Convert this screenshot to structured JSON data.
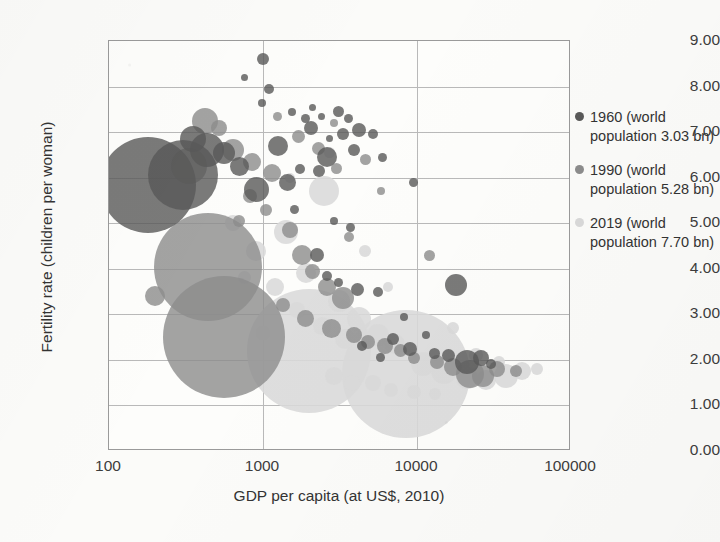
{
  "chart_data": {
    "type": "scatter",
    "title": "",
    "xlabel": "GDP per capita (at US$, 2010)",
    "ylabel": "Fertility rate (children per woman)",
    "x_scale": "log",
    "xlim": [
      100,
      100000
    ],
    "ylim": [
      0,
      9
    ],
    "xticks": [
      "100",
      "1000",
      "10000",
      "100000"
    ],
    "yticks": [
      "0.00",
      "1.00",
      "2.00",
      "3.00",
      "4.00",
      "5.00",
      "6.00",
      "7.00",
      "8.00",
      "9.00"
    ],
    "grid": "horizontal and vertical gridlines at tick values",
    "legend_position": "right",
    "bubble_encoding": "bubble area is proportional to country population",
    "series": [
      {
        "name": "1960 (world population 3.03 bn)",
        "year": 1960,
        "world_population_bn": 3.03,
        "color": "#595959",
        "points": [
          {
            "x": 180,
            "y": 5.85,
            "size": 96
          },
          {
            "x": 300,
            "y": 6.05,
            "size": 70
          },
          {
            "x": 430,
            "y": 6.6,
            "size": 34
          },
          {
            "x": 350,
            "y": 6.85,
            "size": 26
          },
          {
            "x": 560,
            "y": 6.55,
            "size": 22
          },
          {
            "x": 700,
            "y": 6.25,
            "size": 19
          },
          {
            "x": 900,
            "y": 5.75,
            "size": 25
          },
          {
            "x": 1250,
            "y": 6.7,
            "size": 20
          },
          {
            "x": 1000,
            "y": 8.6,
            "size": 12
          },
          {
            "x": 760,
            "y": 8.2,
            "size": 7
          },
          {
            "x": 1100,
            "y": 7.95,
            "size": 10
          },
          {
            "x": 980,
            "y": 7.65,
            "size": 8
          },
          {
            "x": 1550,
            "y": 7.45,
            "size": 8
          },
          {
            "x": 1900,
            "y": 7.3,
            "size": 9
          },
          {
            "x": 2100,
            "y": 7.55,
            "size": 7
          },
          {
            "x": 2400,
            "y": 7.35,
            "size": 7
          },
          {
            "x": 2050,
            "y": 7.1,
            "size": 14
          },
          {
            "x": 3100,
            "y": 7.45,
            "size": 11
          },
          {
            "x": 3600,
            "y": 7.3,
            "size": 9
          },
          {
            "x": 2700,
            "y": 6.85,
            "size": 7
          },
          {
            "x": 3300,
            "y": 6.95,
            "size": 12
          },
          {
            "x": 4200,
            "y": 7.05,
            "size": 14
          },
          {
            "x": 2600,
            "y": 6.45,
            "size": 20
          },
          {
            "x": 1750,
            "y": 6.2,
            "size": 10
          },
          {
            "x": 2300,
            "y": 6.15,
            "size": 12
          },
          {
            "x": 1450,
            "y": 5.9,
            "size": 17
          },
          {
            "x": 3900,
            "y": 6.6,
            "size": 12
          },
          {
            "x": 5200,
            "y": 6.95,
            "size": 10
          },
          {
            "x": 6000,
            "y": 6.45,
            "size": 9
          },
          {
            "x": 1600,
            "y": 5.3,
            "size": 9
          },
          {
            "x": 2900,
            "y": 5.05,
            "size": 8
          },
          {
            "x": 3700,
            "y": 4.9,
            "size": 9
          },
          {
            "x": 2250,
            "y": 4.3,
            "size": 14
          },
          {
            "x": 2600,
            "y": 3.85,
            "size": 10
          },
          {
            "x": 3100,
            "y": 3.7,
            "size": 9
          },
          {
            "x": 4100,
            "y": 3.55,
            "size": 13
          },
          {
            "x": 5600,
            "y": 3.5,
            "size": 10
          },
          {
            "x": 18000,
            "y": 3.65,
            "size": 22
          },
          {
            "x": 9500,
            "y": 5.9,
            "size": 9
          },
          {
            "x": 8200,
            "y": 2.95,
            "size": 8
          },
          {
            "x": 11500,
            "y": 2.55,
            "size": 8
          },
          {
            "x": 7000,
            "y": 2.45,
            "size": 12
          },
          {
            "x": 9000,
            "y": 2.25,
            "size": 14
          },
          {
            "x": 13000,
            "y": 2.15,
            "size": 11
          },
          {
            "x": 16000,
            "y": 2.1,
            "size": 13
          },
          {
            "x": 21000,
            "y": 1.95,
            "size": 24
          },
          {
            "x": 26000,
            "y": 2.05,
            "size": 16
          },
          {
            "x": 30000,
            "y": 1.9,
            "size": 10
          },
          {
            "x": 5800,
            "y": 2.05,
            "size": 9
          },
          {
            "x": 4400,
            "y": 2.3,
            "size": 10
          }
        ]
      },
      {
        "name": "1990 (world population 5.28 bn)",
        "year": 1990,
        "world_population_bn": 5.28,
        "color": "#8c8c8c",
        "points": [
          {
            "x": 440,
            "y": 4.05,
            "size": 108
          },
          {
            "x": 560,
            "y": 2.5,
            "size": 122
          },
          {
            "x": 200,
            "y": 3.4,
            "size": 20
          },
          {
            "x": 330,
            "y": 6.25,
            "size": 36
          },
          {
            "x": 420,
            "y": 7.25,
            "size": 26
          },
          {
            "x": 520,
            "y": 7.1,
            "size": 16
          },
          {
            "x": 640,
            "y": 6.6,
            "size": 22
          },
          {
            "x": 850,
            "y": 6.35,
            "size": 18
          },
          {
            "x": 1150,
            "y": 6.1,
            "size": 18
          },
          {
            "x": 1050,
            "y": 5.3,
            "size": 12
          },
          {
            "x": 1500,
            "y": 4.85,
            "size": 16
          },
          {
            "x": 1800,
            "y": 4.3,
            "size": 20
          },
          {
            "x": 2100,
            "y": 3.95,
            "size": 15
          },
          {
            "x": 2600,
            "y": 3.6,
            "size": 18
          },
          {
            "x": 3300,
            "y": 3.35,
            "size": 22
          },
          {
            "x": 1350,
            "y": 3.2,
            "size": 14
          },
          {
            "x": 1900,
            "y": 2.9,
            "size": 17
          },
          {
            "x": 2800,
            "y": 2.7,
            "size": 19
          },
          {
            "x": 3900,
            "y": 2.55,
            "size": 16
          },
          {
            "x": 4800,
            "y": 2.4,
            "size": 14
          },
          {
            "x": 6200,
            "y": 2.3,
            "size": 16
          },
          {
            "x": 7800,
            "y": 2.2,
            "size": 13
          },
          {
            "x": 1700,
            "y": 6.9,
            "size": 13
          },
          {
            "x": 2300,
            "y": 6.65,
            "size": 13
          },
          {
            "x": 3000,
            "y": 6.2,
            "size": 11
          },
          {
            "x": 1250,
            "y": 7.35,
            "size": 9
          },
          {
            "x": 2900,
            "y": 7.2,
            "size": 8
          },
          {
            "x": 4600,
            "y": 6.4,
            "size": 11
          },
          {
            "x": 5800,
            "y": 5.7,
            "size": 8
          },
          {
            "x": 12000,
            "y": 4.3,
            "size": 11
          },
          {
            "x": 22000,
            "y": 1.7,
            "size": 28
          },
          {
            "x": 27000,
            "y": 1.65,
            "size": 22
          },
          {
            "x": 33000,
            "y": 1.8,
            "size": 16
          },
          {
            "x": 17000,
            "y": 1.85,
            "size": 18
          },
          {
            "x": 13500,
            "y": 1.95,
            "size": 14
          },
          {
            "x": 44000,
            "y": 1.75,
            "size": 12
          },
          {
            "x": 9500,
            "y": 2.05,
            "size": 12
          },
          {
            "x": 820,
            "y": 5.6,
            "size": 14
          },
          {
            "x": 700,
            "y": 5.05,
            "size": 12
          },
          {
            "x": 3600,
            "y": 4.7,
            "size": 10
          }
        ]
      },
      {
        "name": "2019 (world population 7.70 bn)",
        "year": 2019,
        "world_population_bn": 7.7,
        "color": "#d9d9d9",
        "points": [
          {
            "x": 2000,
            "y": 2.2,
            "size": 124
          },
          {
            "x": 8500,
            "y": 1.7,
            "size": 128
          },
          {
            "x": 2500,
            "y": 5.7,
            "size": 30
          },
          {
            "x": 1400,
            "y": 4.8,
            "size": 24
          },
          {
            "x": 900,
            "y": 4.4,
            "size": 20
          },
          {
            "x": 640,
            "y": 5.0,
            "size": 16
          },
          {
            "x": 1900,
            "y": 3.9,
            "size": 20
          },
          {
            "x": 3100,
            "y": 3.3,
            "size": 22
          },
          {
            "x": 4200,
            "y": 2.9,
            "size": 24
          },
          {
            "x": 5600,
            "y": 2.55,
            "size": 22
          },
          {
            "x": 7200,
            "y": 2.35,
            "size": 20
          },
          {
            "x": 1200,
            "y": 3.6,
            "size": 18
          },
          {
            "x": 1650,
            "y": 3.1,
            "size": 16
          },
          {
            "x": 2400,
            "y": 2.75,
            "size": 18
          },
          {
            "x": 3400,
            "y": 2.45,
            "size": 20
          },
          {
            "x": 11000,
            "y": 1.9,
            "size": 24
          },
          {
            "x": 15000,
            "y": 1.75,
            "size": 26
          },
          {
            "x": 21000,
            "y": 1.6,
            "size": 22
          },
          {
            "x": 28000,
            "y": 1.55,
            "size": 20
          },
          {
            "x": 38000,
            "y": 1.65,
            "size": 24
          },
          {
            "x": 48000,
            "y": 1.75,
            "size": 18
          },
          {
            "x": 60000,
            "y": 1.8,
            "size": 12
          },
          {
            "x": 5200,
            "y": 1.5,
            "size": 16
          },
          {
            "x": 6800,
            "y": 1.35,
            "size": 14
          },
          {
            "x": 9500,
            "y": 1.3,
            "size": 14
          },
          {
            "x": 13000,
            "y": 1.25,
            "size": 12
          },
          {
            "x": 2900,
            "y": 1.65,
            "size": 18
          },
          {
            "x": 3800,
            "y": 1.5,
            "size": 16
          },
          {
            "x": 1000,
            "y": 2.6,
            "size": 14
          },
          {
            "x": 760,
            "y": 3.8,
            "size": 13
          },
          {
            "x": 17000,
            "y": 2.7,
            "size": 12
          },
          {
            "x": 24000,
            "y": 2.1,
            "size": 14
          },
          {
            "x": 34000,
            "y": 1.95,
            "size": 12
          },
          {
            "x": 2700,
            "y": 6.55,
            "size": 11
          },
          {
            "x": 1500,
            "y": 6.0,
            "size": 10
          },
          {
            "x": 4600,
            "y": 4.4,
            "size": 12
          },
          {
            "x": 6500,
            "y": 3.6,
            "size": 10
          }
        ]
      }
    ]
  },
  "axes": {
    "y_title": "Fertility rate (children per woman)",
    "x_title": "GDP per capita (at US$, 2010)",
    "yticks": [
      "9.00",
      "8.00",
      "7.00",
      "6.00",
      "5.00",
      "4.00",
      "3.00",
      "2.00",
      "1.00",
      "0.00"
    ],
    "xticks": [
      "100",
      "1000",
      "10000",
      "100000"
    ]
  },
  "legend": {
    "items": [
      {
        "label": "1960 (world population 3.03 bn)",
        "color": "#595959"
      },
      {
        "label": "1990 (world population 5.28 bn)",
        "color": "#8c8c8c"
      },
      {
        "label": "2019 (world population 7.70 bn)",
        "color": "#d9d9d9"
      }
    ]
  }
}
